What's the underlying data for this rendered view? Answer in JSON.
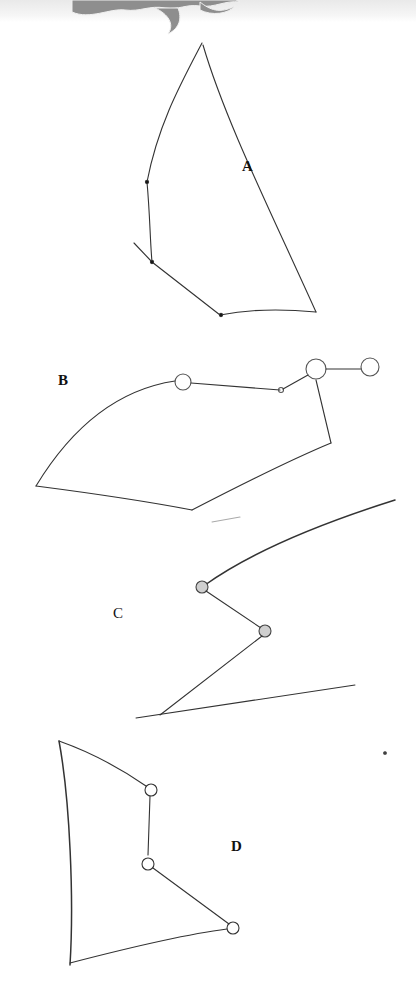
{
  "diagram": {
    "header_graphic": "flame-ornament",
    "figures": [
      {
        "id": "A",
        "label": "A"
      },
      {
        "id": "B",
        "label": "B"
      },
      {
        "id": "C",
        "label": "C"
      },
      {
        "id": "D",
        "label": "D"
      }
    ],
    "colors": {
      "stroke": "#333333",
      "ornament": "#8a8a8a",
      "background": "#ffffff"
    }
  }
}
